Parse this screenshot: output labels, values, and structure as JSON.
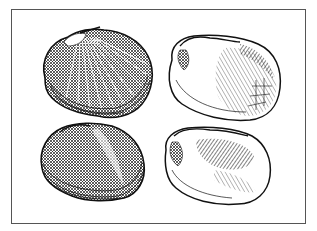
{
  "figure": {
    "frame_color": "#555555",
    "ink_color": "#1a1a1a",
    "background": "#ffffff",
    "panels": [
      {
        "id": "top-left",
        "view": "exterior",
        "description": "ribbed clam shell, exterior view"
      },
      {
        "id": "top-right",
        "view": "interior",
        "description": "clam shell, interior view showing hinge and muscle scars"
      },
      {
        "id": "bottom-left",
        "view": "exterior",
        "description": "clam shell, exterior view with concentric growth lines"
      },
      {
        "id": "bottom-right",
        "view": "interior",
        "description": "clam shell, interior view showing hinge and pallial line"
      }
    ]
  }
}
